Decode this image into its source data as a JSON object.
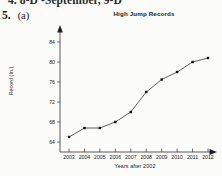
{
  "worksheet": {
    "clipped_line_above": "4.  8-D  -September, 9-D",
    "problem_number": "5.",
    "problem_part": "(a)"
  },
  "chart_data": {
    "type": "line",
    "title": "High Jump Records",
    "xlabel": "Years after 2002",
    "ylabel": "Record (In.)",
    "categories": [
      "2003",
      "2004",
      "2005",
      "2006",
      "2007",
      "2008",
      "2009",
      "2010",
      "2011",
      "2012"
    ],
    "values": [
      65.0,
      66.8,
      66.8,
      68.0,
      70.0,
      74.0,
      76.5,
      78.0,
      80.0,
      80.8
    ],
    "xtick_labels": [
      "2003",
      "2004",
      "2005",
      "2006",
      "2007",
      "2008",
      "2009",
      "2010",
      "2011",
      "2012"
    ],
    "ytick_labels": [
      "84",
      "80",
      "76",
      "72",
      "68",
      "64"
    ],
    "ytick_values": [
      84,
      80,
      76,
      72,
      68,
      64
    ],
    "ylim": [
      62.8,
      85.8
    ],
    "xlim": [
      2002.5,
      2012.8
    ],
    "grid": false,
    "legend": null,
    "marker": "filled-square",
    "line_color": "#2a2a2a",
    "marker_color": "#111111",
    "axis_color": "#333333"
  }
}
